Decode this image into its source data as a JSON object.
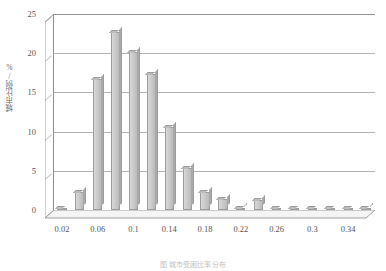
{
  "chart_data": {
    "type": "bar",
    "title": "",
    "xlabel": "",
    "ylabel": "城市比例/%",
    "ylim": [
      0,
      25
    ],
    "yticks": [
      0,
      5,
      10,
      15,
      20,
      25
    ],
    "xtick_labels": [
      "0.02",
      "0.06",
      "0.1",
      "0.14",
      "0.18",
      "0.22",
      "0.26",
      "0.3",
      "0.34"
    ],
    "xtick_values": [
      0.02,
      0.06,
      0.1,
      0.14,
      0.18,
      0.22,
      0.26,
      0.3,
      0.34
    ],
    "grid": true,
    "legend": "none",
    "bar_color": "#c9c9c9",
    "bar_edge_color": "#9c9c9c",
    "axis_color": "#8d8d8d",
    "categories": [
      "0.02",
      "0.04",
      "0.06",
      "0.08",
      "0.1",
      "0.12",
      "0.14",
      "0.16",
      "0.18",
      "0.2",
      "0.22",
      "0.24",
      "0.26",
      "0.28",
      "0.3",
      "0.32",
      "0.34",
      "0.36"
    ],
    "values": [
      0.1,
      2.3,
      16.7,
      22.7,
      20.2,
      17.3,
      10.6,
      5.4,
      2.3,
      1.4,
      0.3,
      1.3,
      0.2,
      0.15,
      0.15,
      0.1,
      0.1,
      0.3
    ]
  },
  "caption": {
    "text": "图  城市受困比率  分布"
  }
}
